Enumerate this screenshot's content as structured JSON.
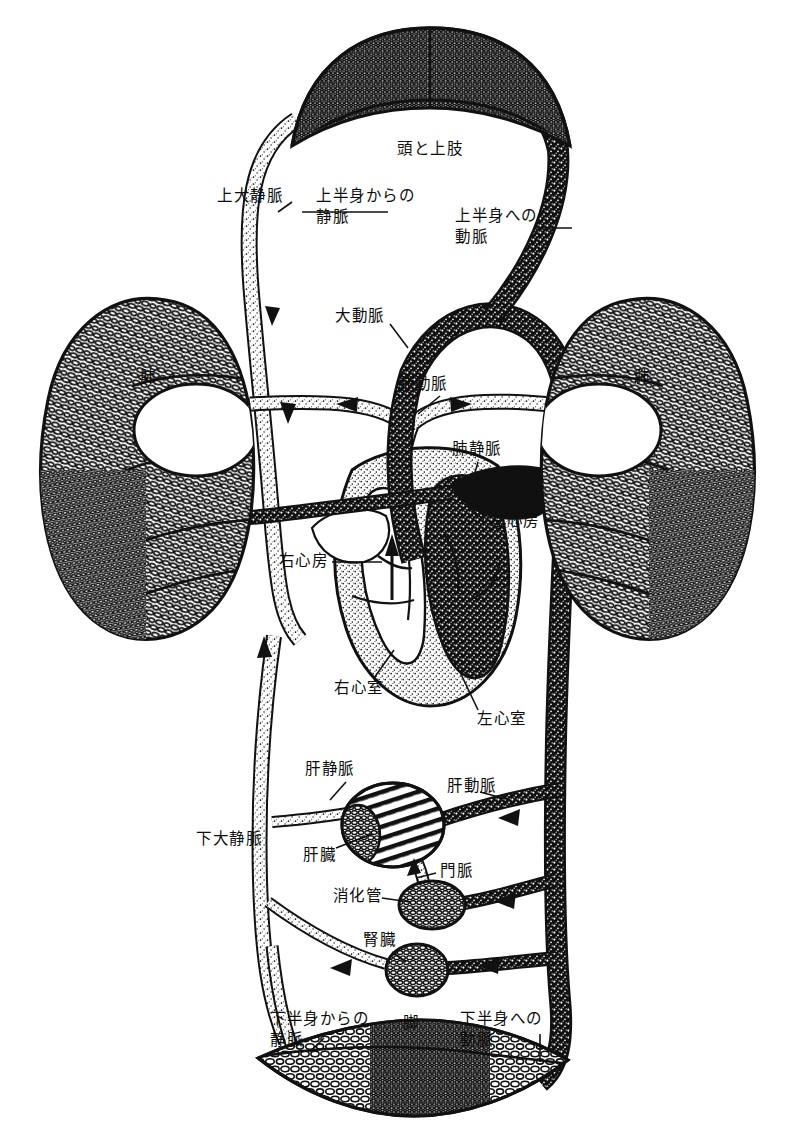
{
  "figure": {
    "language": "ja",
    "style": "line-drawing",
    "ink_color": "#111111",
    "paper_color": "#ffffff"
  },
  "labels": {
    "head_and_upper_limbs": "頭と上肢",
    "superior_vena_cava": "上大静脈",
    "vein_from_upper_body": "上半身からの\n静脈",
    "artery_to_upper_body": "上半身への\n動脈",
    "aorta": "大動脈",
    "pulmonary_artery": "肺動脈",
    "pulmonary_vein": "肺静脈",
    "lung_left": "肺",
    "lung_right": "肺",
    "right_atrium": "右心房",
    "left_atrium": "左心房",
    "right_ventricle": "右心室",
    "left_ventricle": "左心室",
    "hepatic_vein": "肝静脈",
    "hepatic_artery": "肝動脈",
    "inferior_vena_cava": "下大静脈",
    "liver": "肝臓",
    "portal_vein": "門脈",
    "digestive_tract": "消化管",
    "kidney": "腎臓",
    "vein_from_lower_body": "下半身からの\n静脈",
    "leg": "脚",
    "artery_to_lower_body": "下半身への\n動脈"
  },
  "organs": [
    {
      "name": "head-and-upper-limbs-capillary-bed",
      "label": "頭と上肢"
    },
    {
      "name": "lung-left",
      "label": "肺"
    },
    {
      "name": "lung-right",
      "label": "肺"
    },
    {
      "name": "heart",
      "label": ""
    },
    {
      "name": "liver",
      "label": "肝臓"
    },
    {
      "name": "digestive-tract",
      "label": "消化管"
    },
    {
      "name": "kidney",
      "label": "腎臓"
    },
    {
      "name": "leg-capillary-bed",
      "label": "脚"
    }
  ],
  "vessels": [
    {
      "name": "superior-vena-cava",
      "label": "上大静脈",
      "kind": "vein"
    },
    {
      "name": "vein-from-upper-body",
      "label": "上半身からの静脈",
      "kind": "vein"
    },
    {
      "name": "artery-to-upper-body",
      "label": "上半身への動脈",
      "kind": "artery"
    },
    {
      "name": "aorta",
      "label": "大動脈",
      "kind": "artery"
    },
    {
      "name": "pulmonary-artery",
      "label": "肺動脈",
      "kind": "artery"
    },
    {
      "name": "pulmonary-vein",
      "label": "肺静脈",
      "kind": "vein"
    },
    {
      "name": "hepatic-vein",
      "label": "肝静脈",
      "kind": "vein"
    },
    {
      "name": "hepatic-artery",
      "label": "肝動脈",
      "kind": "artery"
    },
    {
      "name": "portal-vein",
      "label": "門脈",
      "kind": "vein"
    },
    {
      "name": "inferior-vena-cava",
      "label": "下大静脈",
      "kind": "vein"
    },
    {
      "name": "vein-from-lower-body",
      "label": "下半身からの静脈",
      "kind": "vein"
    },
    {
      "name": "artery-to-lower-body",
      "label": "下半身への動脈",
      "kind": "artery"
    }
  ],
  "chambers": [
    {
      "name": "right-atrium",
      "label": "右心房"
    },
    {
      "name": "left-atrium",
      "label": "左心房"
    },
    {
      "name": "right-ventricle",
      "label": "右心室"
    },
    {
      "name": "left-ventricle",
      "label": "左心室"
    }
  ]
}
